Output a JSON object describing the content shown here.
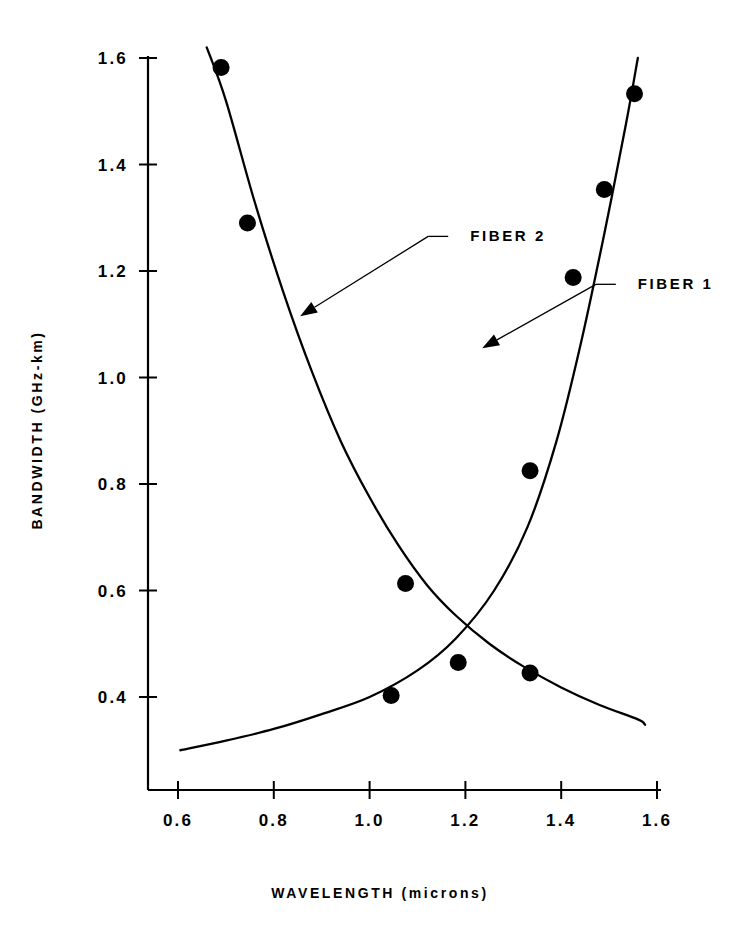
{
  "chart_data": {
    "type": "scatter",
    "title": "",
    "xlabel": "WAVELENGTH (microns)",
    "ylabel": "BANDWIDTH (GHz-km)",
    "xlim": [
      0.55,
      1.62
    ],
    "ylim": [
      0.3,
      1.65
    ],
    "xticks": [
      "0.6",
      "0.8",
      "1.0",
      "1.2",
      "1.4",
      "1.6"
    ],
    "xtick_values": [
      0.6,
      0.8,
      1.0,
      1.2,
      1.4,
      1.6
    ],
    "yticks": [
      "0.4",
      "0.6",
      "0.8",
      "1.0",
      "1.2",
      "1.4",
      "1.6"
    ],
    "ytick_values": [
      0.4,
      0.6,
      0.8,
      1.0,
      1.2,
      1.4,
      1.6
    ],
    "grid": false,
    "legend_position": "inline-annotations",
    "annotations": [
      {
        "label": "FIBER 2",
        "text_x": 1.21,
        "text_y": 1.265,
        "point_x": 0.855,
        "point_y": 1.115
      },
      {
        "label": "FIBER 1",
        "text_x": 1.56,
        "text_y": 1.175,
        "point_x": 1.235,
        "point_y": 1.055
      }
    ],
    "series": [
      {
        "name": "FIBER 1",
        "marker": "filled-circle",
        "points": [
          {
            "x": 1.045,
            "y": 0.403
          },
          {
            "x": 1.335,
            "y": 0.825
          },
          {
            "x": 1.425,
            "y": 1.188
          },
          {
            "x": 1.49,
            "y": 1.353
          },
          {
            "x": 1.553,
            "y": 1.533
          }
        ],
        "curve": [
          {
            "x": 0.605,
            "y": 0.3
          },
          {
            "x": 0.7,
            "y": 0.318
          },
          {
            "x": 0.8,
            "y": 0.34
          },
          {
            "x": 0.9,
            "y": 0.368
          },
          {
            "x": 1.0,
            "y": 0.4
          },
          {
            "x": 1.1,
            "y": 0.45
          },
          {
            "x": 1.18,
            "y": 0.51
          },
          {
            "x": 1.26,
            "y": 0.6
          },
          {
            "x": 1.33,
            "y": 0.72
          },
          {
            "x": 1.39,
            "y": 0.88
          },
          {
            "x": 1.44,
            "y": 1.06
          },
          {
            "x": 1.49,
            "y": 1.27
          },
          {
            "x": 1.535,
            "y": 1.475
          },
          {
            "x": 1.56,
            "y": 1.6
          }
        ]
      },
      {
        "name": "FIBER 2",
        "marker": "filled-circle",
        "points": [
          {
            "x": 0.69,
            "y": 1.582
          },
          {
            "x": 0.745,
            "y": 1.29
          },
          {
            "x": 1.075,
            "y": 0.613
          },
          {
            "x": 1.185,
            "y": 0.465
          },
          {
            "x": 1.335,
            "y": 0.445
          }
        ],
        "curve": [
          {
            "x": 0.66,
            "y": 1.62
          },
          {
            "x": 0.7,
            "y": 1.52
          },
          {
            "x": 0.76,
            "y": 1.33
          },
          {
            "x": 0.82,
            "y": 1.16
          },
          {
            "x": 0.88,
            "y": 1.01
          },
          {
            "x": 0.94,
            "y": 0.88
          },
          {
            "x": 1.0,
            "y": 0.775
          },
          {
            "x": 1.06,
            "y": 0.685
          },
          {
            "x": 1.12,
            "y": 0.61
          },
          {
            "x": 1.18,
            "y": 0.553
          },
          {
            "x": 1.25,
            "y": 0.5
          },
          {
            "x": 1.32,
            "y": 0.458
          },
          {
            "x": 1.4,
            "y": 0.418
          },
          {
            "x": 1.48,
            "y": 0.385
          },
          {
            "x": 1.56,
            "y": 0.358
          },
          {
            "x": 1.575,
            "y": 0.348
          }
        ]
      }
    ]
  }
}
